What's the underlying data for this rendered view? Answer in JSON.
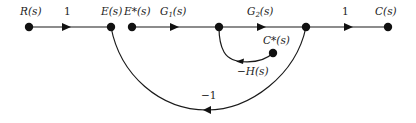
{
  "diagram": {
    "type": "signal-flow-graph",
    "nodes": [
      {
        "id": "R",
        "label": "R(s)",
        "x": 29,
        "y": 27
      },
      {
        "id": "E",
        "label": "E(s)",
        "x": 111,
        "y": 27
      },
      {
        "id": "Estar",
        "label": "E*(s)",
        "x": 132,
        "y": 27
      },
      {
        "id": "N1",
        "label": "",
        "x": 219,
        "y": 27
      },
      {
        "id": "N2",
        "label": "",
        "x": 306,
        "y": 27
      },
      {
        "id": "C",
        "label": "C(s)",
        "x": 388,
        "y": 27
      },
      {
        "id": "Cstar",
        "label": "C*(s)",
        "x": 273,
        "y": 53
      }
    ],
    "branches": [
      {
        "from": "R",
        "to": "E",
        "gain": "1"
      },
      {
        "from": "Estar",
        "to": "N1",
        "gain": "G1(s)"
      },
      {
        "from": "N1",
        "to": "N2",
        "gain": "G2(s)"
      },
      {
        "from": "N2",
        "to": "C",
        "gain": "1"
      },
      {
        "from": "Cstar",
        "to": "N1",
        "gain": "−H(s)"
      },
      {
        "from": "N2",
        "to": "E",
        "gain": "−1"
      }
    ]
  },
  "labels": {
    "R": "R(s)",
    "E": "E(s)",
    "Estar": "E*(s)",
    "C": "C(s)",
    "Cstar": "C*(s)",
    "gain_R_E": "1",
    "G1_main": "G",
    "G1_sub": "1",
    "G1_tail": "(s)",
    "G2_main": "G",
    "G2_sub": "2",
    "G2_tail": "(s)",
    "gain_N2_C": "1",
    "neg_H": "−H(s)",
    "neg_one": "−1"
  }
}
